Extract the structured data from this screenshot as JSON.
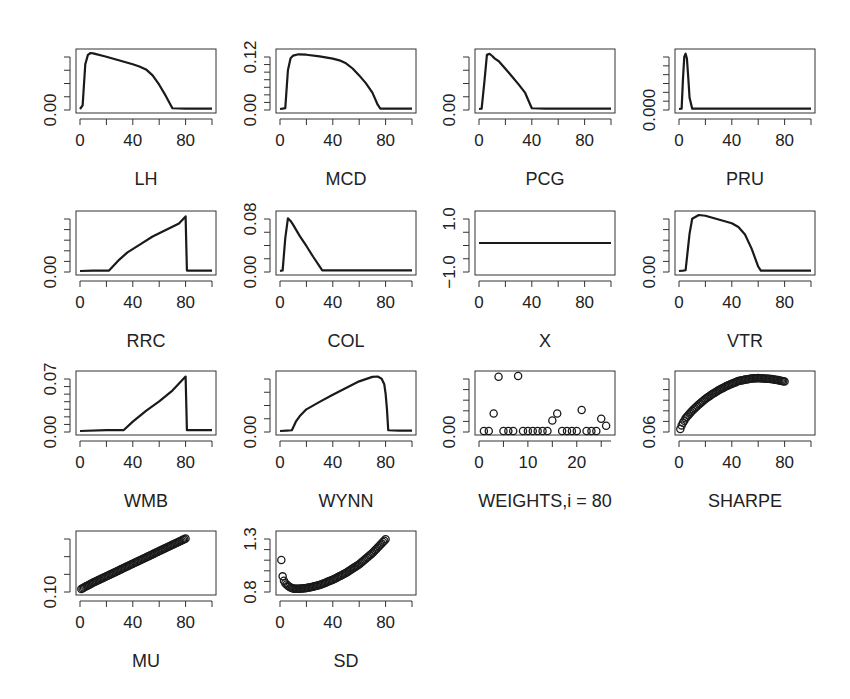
{
  "figure": {
    "layout": {
      "rows": 4,
      "cols": 4,
      "panel_count": 14
    },
    "colors": {
      "line": "#1a1a1a",
      "box": "#333333",
      "background": "#ffffff"
    }
  },
  "chart_data": [
    {
      "id": "LH",
      "type": "line",
      "xlabel": "LH",
      "ylabel": "",
      "x_ticks": [
        0,
        40,
        80
      ],
      "y_tick_labels": [
        "0.00"
      ],
      "xlim": [
        0,
        100
      ],
      "ylim": [
        0,
        0.15
      ],
      "y_minor_ticks": 4,
      "x": [
        0,
        2,
        4,
        6,
        8,
        10,
        20,
        30,
        40,
        45,
        50,
        55,
        60,
        65,
        70,
        80,
        90,
        100
      ],
      "values": [
        0,
        0.01,
        0.12,
        0.145,
        0.15,
        0.149,
        0.14,
        0.13,
        0.12,
        0.114,
        0.106,
        0.09,
        0.065,
        0.035,
        0.002,
        0.001,
        0.001,
        0.001
      ]
    },
    {
      "id": "MCD",
      "type": "line",
      "xlabel": "MCD",
      "ylabel": "",
      "x_ticks": [
        0,
        40,
        80
      ],
      "y_tick_labels": [
        "0.00",
        "0.12"
      ],
      "xlim": [
        0,
        100
      ],
      "ylim": [
        0,
        0.13
      ],
      "y_minor_ticks": 7,
      "x": [
        0,
        2,
        4,
        6,
        8,
        10,
        14,
        20,
        30,
        40,
        45,
        50,
        55,
        60,
        65,
        70,
        74,
        76,
        80,
        90,
        100
      ],
      "values": [
        0,
        0.001,
        0.002,
        0.09,
        0.118,
        0.124,
        0.127,
        0.126,
        0.122,
        0.117,
        0.113,
        0.106,
        0.094,
        0.078,
        0.06,
        0.038,
        0.01,
        0.001,
        0.001,
        0.001,
        0.001
      ]
    },
    {
      "id": "PCG",
      "type": "line",
      "xlabel": "PCG",
      "ylabel": "",
      "x_ticks": [
        0,
        40,
        80
      ],
      "y_tick_labels": [
        "0.00"
      ],
      "xlim": [
        0,
        100
      ],
      "ylim": [
        0,
        0.15
      ],
      "y_minor_ticks": 4,
      "x": [
        0,
        2,
        4,
        6,
        8,
        10,
        12,
        15,
        20,
        25,
        30,
        35,
        40,
        50,
        60,
        80,
        100
      ],
      "values": [
        0,
        0.001,
        0.07,
        0.145,
        0.148,
        0.142,
        0.135,
        0.128,
        0.108,
        0.087,
        0.066,
        0.043,
        0.002,
        0.001,
        0.001,
        0.001,
        0.001
      ]
    },
    {
      "id": "PRU",
      "type": "line",
      "xlabel": "PRU",
      "ylabel": "",
      "x_ticks": [
        0,
        40,
        80
      ],
      "y_tick_labels": [
        "0.000"
      ],
      "xlim": [
        0,
        100
      ],
      "ylim": [
        0,
        0.15
      ],
      "y_minor_ticks": 6,
      "x": [
        0,
        2,
        3,
        4,
        5,
        6,
        7,
        8,
        10,
        20,
        40,
        60,
        80,
        100
      ],
      "values": [
        0,
        0.001,
        0.08,
        0.14,
        0.148,
        0.135,
        0.085,
        0.03,
        0.001,
        0.001,
        0.001,
        0.001,
        0.001,
        0.001
      ]
    },
    {
      "id": "RRC",
      "type": "line",
      "xlabel": "RRC",
      "ylabel": "",
      "x_ticks": [
        0,
        40,
        80
      ],
      "y_tick_labels": [
        "0.00"
      ],
      "xlim": [
        0,
        100
      ],
      "ylim": [
        0,
        0.12
      ],
      "y_minor_ticks": 5,
      "x": [
        0,
        10,
        20,
        22,
        30,
        36,
        45,
        55,
        65,
        75,
        80,
        81,
        90,
        100
      ],
      "values": [
        0,
        0.001,
        0.001,
        0.001,
        0.025,
        0.04,
        0.056,
        0.074,
        0.088,
        0.102,
        0.117,
        0.001,
        0.001,
        0.001
      ]
    },
    {
      "id": "COL",
      "type": "line",
      "xlabel": "COL",
      "ylabel": "",
      "x_ticks": [
        0,
        40,
        80
      ],
      "y_tick_labels": [
        "0.00",
        "0.08"
      ],
      "xlim": [
        0,
        100
      ],
      "ylim": [
        0,
        0.085
      ],
      "y_minor_ticks": 4,
      "x": [
        0,
        2,
        4,
        6,
        8,
        10,
        15,
        20,
        25,
        30,
        32,
        40,
        60,
        80,
        100
      ],
      "values": [
        0,
        0.001,
        0.05,
        0.08,
        0.076,
        0.07,
        0.053,
        0.038,
        0.022,
        0.007,
        0.001,
        0.001,
        0.001,
        0.001,
        0.001
      ]
    },
    {
      "id": "X",
      "type": "line",
      "xlabel": "X",
      "ylabel": "",
      "x_ticks": [
        0,
        40,
        80
      ],
      "y_tick_labels": [
        "-1.0",
        "1.0"
      ],
      "xlim": [
        0,
        100
      ],
      "ylim": [
        -1,
        1
      ],
      "y_minor_ticks": 4,
      "x": [
        0,
        100
      ],
      "values": [
        0,
        0
      ]
    },
    {
      "id": "VTR",
      "type": "line",
      "xlabel": "VTR",
      "ylabel": "",
      "x_ticks": [
        0,
        40,
        80
      ],
      "y_tick_labels": [
        "0.00"
      ],
      "xlim": [
        0,
        100
      ],
      "ylim": [
        0,
        0.15
      ],
      "y_minor_ticks": 5,
      "x": [
        0,
        3,
        5,
        8,
        10,
        15,
        20,
        30,
        40,
        45,
        50,
        55,
        60,
        62,
        80,
        100
      ],
      "values": [
        0,
        0.001,
        0.002,
        0.1,
        0.14,
        0.15,
        0.148,
        0.138,
        0.128,
        0.118,
        0.098,
        0.06,
        0.012,
        0.001,
        0.001,
        0.001
      ]
    },
    {
      "id": "WMB",
      "type": "line",
      "xlabel": "WMB",
      "ylabel": "",
      "x_ticks": [
        0,
        40,
        80
      ],
      "y_tick_labels": [
        "0.00",
        "0.07"
      ],
      "xlim": [
        0,
        100
      ],
      "ylim": [
        0,
        0.072
      ],
      "y_minor_ticks": 7,
      "x": [
        0,
        20,
        33,
        40,
        50,
        60,
        70,
        80,
        81,
        90,
        100
      ],
      "values": [
        0,
        0.001,
        0.001,
        0.012,
        0.026,
        0.038,
        0.052,
        0.07,
        0.001,
        0.001,
        0.001
      ]
    },
    {
      "id": "WYNN",
      "type": "line",
      "xlabel": "WYNN",
      "ylabel": "",
      "x_ticks": [
        0,
        40,
        80
      ],
      "y_tick_labels": [
        "0.00"
      ],
      "xlim": [
        0,
        100
      ],
      "ylim": [
        0,
        0.15
      ],
      "y_minor_ticks": 4,
      "x": [
        0,
        5,
        9,
        12,
        15,
        20,
        30,
        40,
        50,
        60,
        70,
        74,
        77,
        79,
        80,
        81,
        82,
        90,
        100
      ],
      "values": [
        0,
        0.001,
        0.002,
        0.025,
        0.04,
        0.058,
        0.078,
        0.097,
        0.115,
        0.133,
        0.145,
        0.146,
        0.14,
        0.125,
        0.1,
        0.06,
        0.002,
        0.001,
        0.001
      ]
    },
    {
      "id": "WEIGHTS",
      "type": "scatter",
      "xlabel": "WEIGHTS,i = 80",
      "ylabel": "",
      "x_ticks": [
        0,
        10,
        20
      ],
      "y_tick_labels": [
        "0.00"
      ],
      "xlim": [
        0,
        27
      ],
      "ylim": [
        0,
        0.16
      ],
      "y_minor_ticks": 5,
      "x": [
        1,
        2,
        3,
        4,
        5,
        6,
        7,
        8,
        9,
        10,
        11,
        12,
        13,
        14,
        15,
        16,
        17,
        18,
        19,
        20,
        21,
        22,
        23,
        24,
        25,
        26
      ],
      "values": [
        0,
        0,
        0.05,
        0.155,
        0,
        0,
        0,
        0.157,
        0,
        0,
        0,
        0,
        0,
        0,
        0.03,
        0.05,
        0,
        0,
        0,
        0,
        0.06,
        0,
        0,
        0,
        0.035,
        0.015
      ]
    },
    {
      "id": "SHARPE",
      "type": "scatter",
      "xlabel": "SHARPE",
      "ylabel": "",
      "x_ticks": [
        0,
        40,
        80
      ],
      "y_tick_labels": [
        "0.06"
      ],
      "xlim": [
        0,
        100
      ],
      "ylim": [
        0.06,
        0.17
      ],
      "y_minor_ticks": 5,
      "x": [
        1,
        2,
        3,
        4,
        5,
        10,
        15,
        20,
        25,
        30,
        35,
        40,
        45,
        50,
        55,
        60,
        65,
        70,
        75,
        80
      ],
      "values": [
        0.064,
        0.071,
        0.076,
        0.08,
        0.085,
        0.1,
        0.112,
        0.123,
        0.132,
        0.14,
        0.147,
        0.153,
        0.158,
        0.161,
        0.163,
        0.164,
        0.163,
        0.162,
        0.16,
        0.157
      ]
    },
    {
      "id": "MU",
      "type": "scatter",
      "xlabel": "MU",
      "ylabel": "",
      "x_ticks": [
        0,
        40,
        80
      ],
      "y_tick_labels": [
        "0.10"
      ],
      "xlim": [
        0,
        100
      ],
      "ylim": [
        0.08,
        0.16
      ],
      "y_minor_ticks": 3,
      "x": [
        1,
        10,
        20,
        30,
        40,
        50,
        60,
        70,
        80
      ],
      "values": [
        0.083,
        0.092,
        0.101,
        0.11,
        0.119,
        0.128,
        0.137,
        0.146,
        0.155
      ]
    },
    {
      "id": "SD",
      "type": "scatter",
      "xlabel": "SD",
      "ylabel": "",
      "x_ticks": [
        0,
        40,
        80
      ],
      "y_tick_labels": [
        "0.8",
        "1.3"
      ],
      "xlim": [
        0,
        100
      ],
      "ylim": [
        0.7,
        1.35
      ],
      "y_minor_ticks": 5,
      "x": [
        1,
        2,
        3,
        4,
        6,
        8,
        10,
        12,
        15,
        20,
        25,
        30,
        40,
        50,
        60,
        70,
        80
      ],
      "values": [
        1.06,
        0.87,
        0.82,
        0.79,
        0.76,
        0.74,
        0.73,
        0.725,
        0.726,
        0.735,
        0.75,
        0.77,
        0.83,
        0.91,
        1.01,
        1.14,
        1.3
      ]
    }
  ]
}
